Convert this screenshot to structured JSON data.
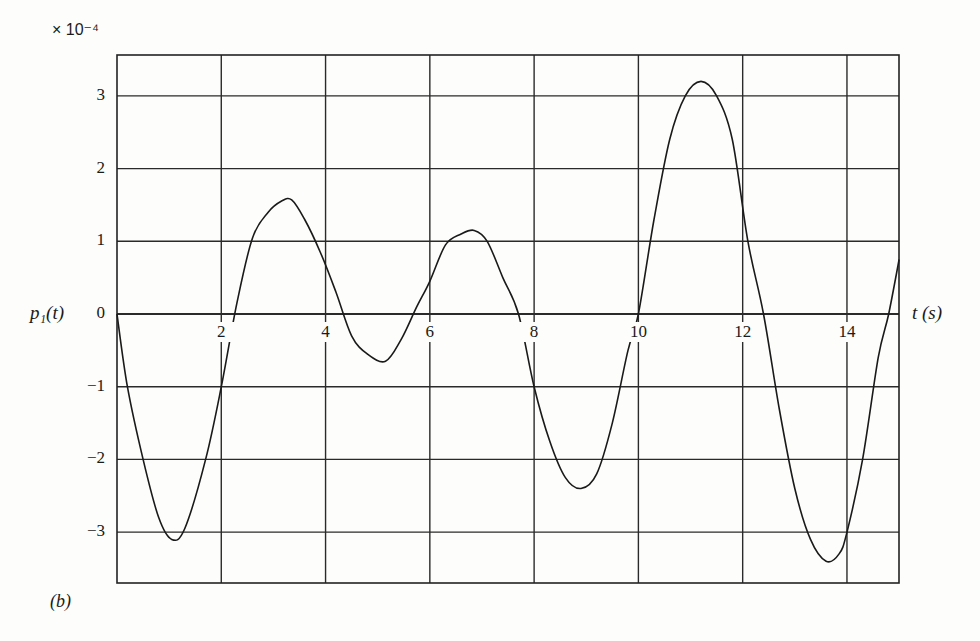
{
  "chart_data": {
    "type": "line",
    "title": "",
    "panel_label": "(b)",
    "scale_label": "× 10⁻⁴",
    "ylabel": "p₁(t)",
    "xlabel": "t (s)",
    "xlim": [
      0,
      15
    ],
    "ylim": [
      -3.7,
      3.55
    ],
    "grid": true,
    "x_ticks": [
      2,
      4,
      6,
      8,
      10,
      12,
      14
    ],
    "y_ticks": [
      3,
      2,
      1,
      0,
      -1,
      -2,
      -3
    ],
    "x_tick_labels": [
      "2",
      "4",
      "6",
      "8",
      "10",
      "12",
      "14"
    ],
    "y_tick_labels": [
      "3",
      "2",
      "1",
      "0",
      "−1",
      "−2",
      "−3"
    ],
    "series": [
      {
        "name": "p1(t)",
        "x": [
          0,
          0.2,
          0.5,
          0.8,
          1.05,
          1.3,
          1.7,
          2.0,
          2.3,
          2.6,
          2.9,
          3.15,
          3.35,
          3.6,
          3.9,
          4.2,
          4.5,
          4.8,
          5.15,
          5.45,
          5.75,
          6.0,
          6.3,
          6.6,
          6.85,
          7.1,
          7.4,
          7.7,
          8.0,
          8.3,
          8.6,
          8.9,
          9.2,
          9.5,
          9.8,
          10.0,
          10.3,
          10.6,
          10.9,
          11.2,
          11.5,
          11.8,
          12.1,
          12.4,
          12.7,
          13.0,
          13.3,
          13.6,
          13.85,
          14.0,
          14.3,
          14.6,
          14.8,
          15.0
        ],
        "y": [
          0,
          -1.0,
          -2.0,
          -2.8,
          -3.1,
          -2.95,
          -2.0,
          -1.0,
          0.15,
          1.05,
          1.4,
          1.55,
          1.57,
          1.3,
          0.85,
          0.3,
          -0.3,
          -0.55,
          -0.65,
          -0.35,
          0.1,
          0.45,
          0.95,
          1.1,
          1.15,
          1.0,
          0.5,
          0.0,
          -1.0,
          -1.75,
          -2.25,
          -2.4,
          -2.2,
          -1.5,
          -0.5,
          0.0,
          1.3,
          2.4,
          3.0,
          3.2,
          3.0,
          2.4,
          1.0,
          0.0,
          -1.3,
          -2.4,
          -3.1,
          -3.4,
          -3.3,
          -3.0,
          -2.0,
          -0.6,
          0.0,
          0.75
        ]
      }
    ]
  }
}
